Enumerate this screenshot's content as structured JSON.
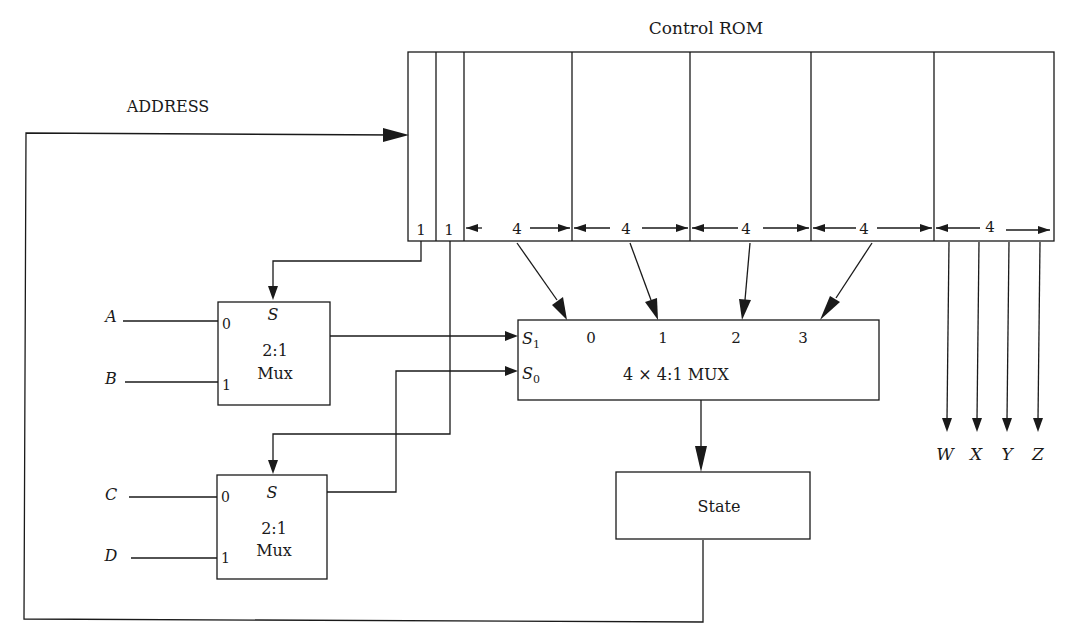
{
  "title": "Control ROM",
  "address_label": "ADDRESS",
  "rom_fields": [
    "1",
    "1",
    "4",
    "4",
    "4",
    "4",
    "4"
  ],
  "mux_top": {
    "select": "S",
    "in0": "0",
    "in1": "1",
    "type": "2:1",
    "name": "Mux",
    "input_a": "A",
    "input_b": "B"
  },
  "mux_bottom": {
    "select": "S",
    "in0": "0",
    "in1": "1",
    "type": "2:1",
    "name": "Mux",
    "input_a": "C",
    "input_b": "D"
  },
  "big_mux": {
    "s1": "S",
    "s1_sub": "1",
    "s0": "S",
    "s0_sub": "0",
    "inputs": [
      "0",
      "1",
      "2",
      "3"
    ],
    "label": "4 × 4:1 MUX"
  },
  "state_label": "State",
  "outputs": [
    "W",
    "X",
    "Y",
    "Z"
  ]
}
